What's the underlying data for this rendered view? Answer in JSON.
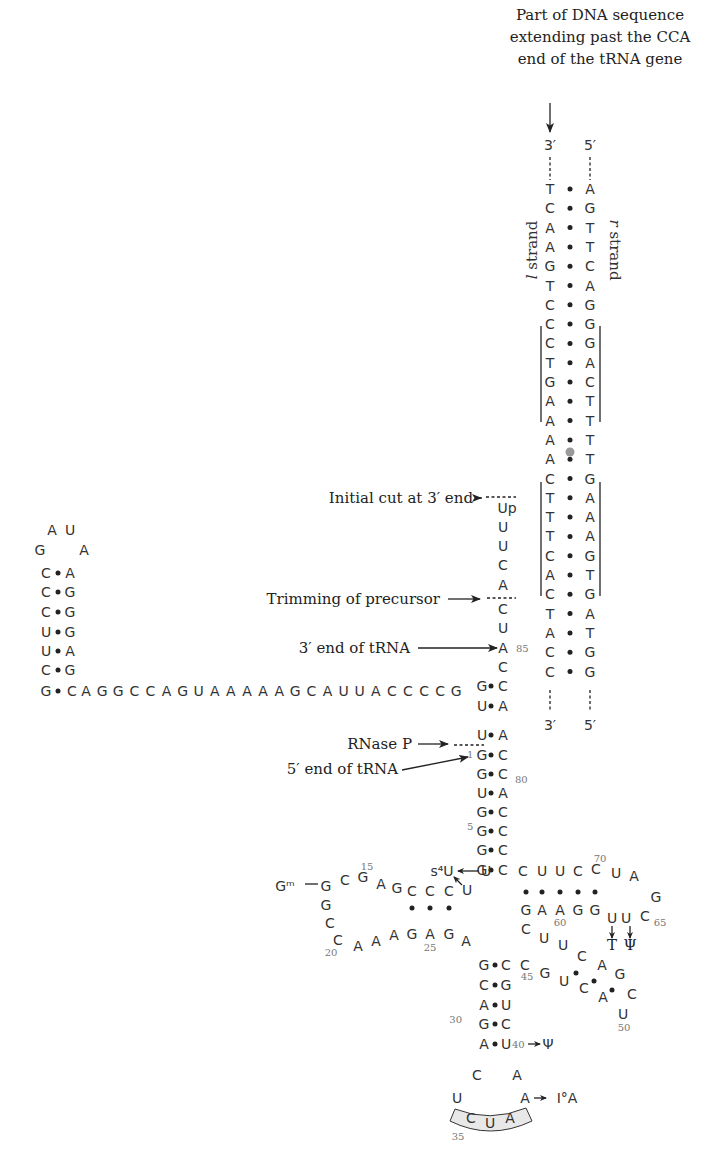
{
  "title_annotation": {
    "lines": [
      "Part of DNA sequence",
      "extending past the CCA",
      "end of the tRNA gene"
    ],
    "x": 600,
    "y": [
      20,
      42,
      64
    ]
  },
  "dna": {
    "left_end": "3′",
    "right_end": "5′",
    "left_bottom": "3′",
    "right_bottom": "5′",
    "l_strand_label": "l strand",
    "r_strand_label": "r strand",
    "l_strand": [
      "T",
      "C",
      "A",
      "A",
      "G",
      "T",
      "C",
      "C",
      "C",
      "T",
      "G",
      "A",
      "A",
      "A",
      "A",
      "C",
      "T",
      "T",
      "T",
      "C",
      "A",
      "C",
      "T",
      "A",
      "C",
      "C"
    ],
    "r_strand": [
      "A",
      "G",
      "T",
      "T",
      "C",
      "A",
      "G",
      "G",
      "G",
      "A",
      "C",
      "T",
      "T",
      "T",
      "T",
      "G",
      "A",
      "A",
      "A",
      "G",
      "T",
      "G",
      "A",
      "T",
      "G",
      "G"
    ],
    "x_left": 550,
    "x_right": 590,
    "y0": 194,
    "dy": 19.3
  },
  "labels": {
    "initial_cut": "Initial cut at 3′ end",
    "trimming": "Trimming of precursor",
    "three_prime_end": "3′ end of tRNA",
    "rnase_p": "RNase P",
    "five_prime_end": "5′ end of tRNA"
  },
  "acceptor_tail": [
    "Up",
    "U",
    "U",
    "C",
    "A",
    "C",
    "U",
    "A",
    "C"
  ],
  "tail_numbers": {
    "n85": "85"
  },
  "acceptor_stem": {
    "left": [
      "G",
      "U",
      "G",
      "G",
      "U",
      "G",
      "G",
      "G",
      "G"
    ],
    "right": [
      "C",
      "A",
      "C",
      "C",
      "A",
      "C",
      "C",
      "C",
      "C"
    ],
    "numbers": {
      "n1": "1",
      "n80": "80",
      "n5": "5"
    }
  },
  "leader": {
    "sequence": "AGGCCAGUAAAAAGCAUUACCCCG",
    "hairpin_left": [
      "C",
      "C",
      "C",
      "U",
      "U",
      "C"
    ],
    "hairpin_right": [
      "A",
      "G",
      "G",
      "G",
      "A",
      "G"
    ],
    "loop": [
      "G",
      "A",
      "U",
      "A"
    ],
    "closing": "G"
  },
  "d_arm": {
    "gm": "Gᵐ",
    "numbers": {
      "n15": "15",
      "n20": "20",
      "n25": "25"
    },
    "s4u": "s⁴U"
  },
  "t_arm": {
    "top": [
      "C",
      "U",
      "U",
      "C",
      "C"
    ],
    "loop": [
      "U",
      "A",
      "A",
      "G",
      "C"
    ],
    "bottom": [
      "G",
      "A",
      "A",
      "G",
      "G"
    ],
    "mods": [
      "T",
      "Ψ"
    ],
    "numbers": {
      "n70": "70",
      "n65": "65",
      "n60": "60",
      "n50": "50",
      "n45": "45"
    }
  },
  "anticodon_arm": {
    "left": [
      "G",
      "C",
      "A",
      "G",
      "A"
    ],
    "right": [
      "C",
      "G",
      "U",
      "C",
      "U"
    ],
    "anticodon": [
      "C",
      "U",
      "A"
    ],
    "numbers": {
      "n30": "30",
      "n40": "40",
      "n35": "35"
    },
    "mod40": "Ψ",
    "mod37": "I°A"
  }
}
